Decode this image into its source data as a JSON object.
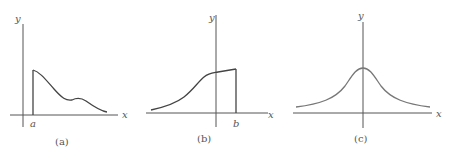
{
  "figure": {
    "panels": [
      {
        "id": "a",
        "caption": "(a)",
        "x_label": "x",
        "y_label": "y",
        "marker_label": "a",
        "description": "Curve starting at x=a with a vertical jump, decreasing with a small bump, approaching x-axis"
      },
      {
        "id": "b",
        "caption": "(b)",
        "x_label": "x",
        "y_label": "y",
        "marker_label": "b",
        "description": "Increasing S-shaped curve from the left ending at x=b with a vertical drop to the axis"
      },
      {
        "id": "c",
        "caption": "(c)",
        "x_label": "x",
        "y_label": "y",
        "description": "Symmetric bell-shaped curve centered on the y-axis with tails approaching the x-axis"
      }
    ],
    "colors": {
      "axis": "#555555",
      "curve_ab": "#444444",
      "curve_c": "#777777"
    }
  }
}
